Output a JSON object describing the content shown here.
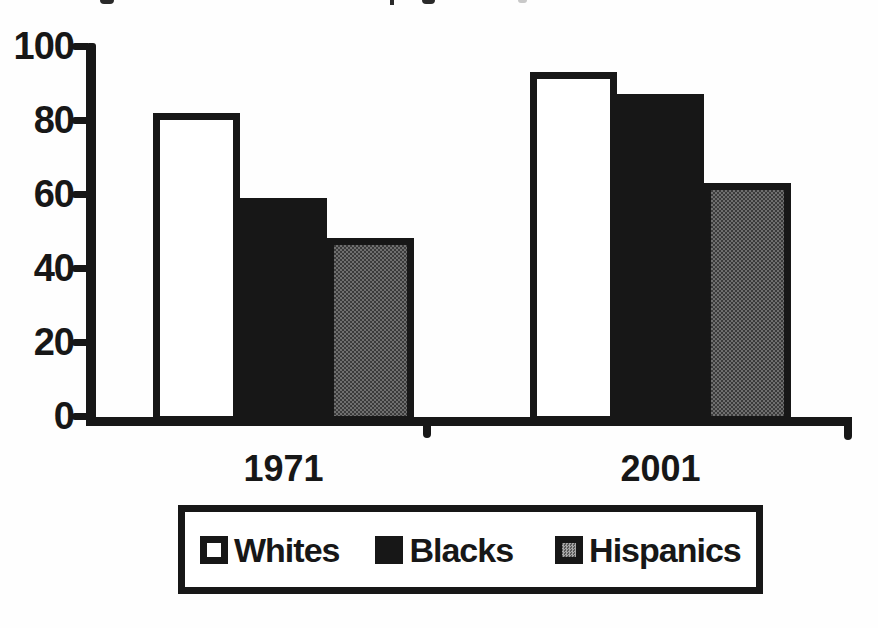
{
  "chart_data": {
    "type": "bar",
    "categories": [
      "1971",
      "2001"
    ],
    "series": [
      {
        "name": "Whites",
        "values": [
          82,
          93
        ],
        "style": "white"
      },
      {
        "name": "Blacks",
        "values": [
          59,
          87
        ],
        "style": "black"
      },
      {
        "name": "Hispanics",
        "values": [
          48,
          63
        ],
        "style": "gray"
      }
    ],
    "title": "",
    "xlabel": "",
    "ylabel": "",
    "ylim": [
      0,
      100
    ],
    "yticks": [
      100,
      80,
      60,
      40,
      20,
      0
    ],
    "grid": false,
    "legend_position": "bottom-center",
    "colors": {
      "bar_border": "#171717",
      "white_fill": "#ffffff",
      "black_fill": "#171717",
      "gray_fill": "#565656",
      "background": "#fefefe"
    }
  }
}
